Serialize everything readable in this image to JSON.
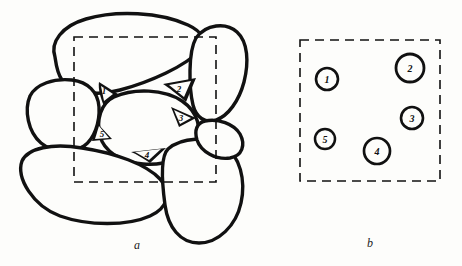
{
  "figure": {
    "background_color": "#fdfdfb",
    "ink_color": "#111111",
    "panels": [
      {
        "id": "a",
        "caption": "a",
        "description": "grain-packing-with-pore-spaces"
      },
      {
        "id": "b",
        "caption": "b",
        "description": "abstracted-pore-centers"
      }
    ]
  },
  "panel_a": {
    "caption": "a",
    "dashed_window": {
      "x": 74,
      "y": 37,
      "width": 142,
      "height": 145,
      "stroke": "#111111",
      "dash": "9 6",
      "stroke_width": 1.6
    },
    "grain_stroke": "#111111",
    "grain_stroke_width": 3.4,
    "grain_fill": "#fdfdfb",
    "pore_labels": [
      {
        "id": "1",
        "text": "1",
        "x": 106,
        "y": 91
      },
      {
        "id": "2",
        "text": "2",
        "x": 179,
        "y": 66
      },
      {
        "id": "3",
        "text": "3",
        "x": 180,
        "y": 115
      },
      {
        "id": "4",
        "text": "4",
        "x": 146,
        "y": 148
      },
      {
        "id": "5",
        "text": "5",
        "x": 104,
        "y": 133
      }
    ]
  },
  "panel_b": {
    "caption": "b",
    "dashed_window": {
      "x": 50,
      "y": 40,
      "width": 140,
      "height": 141,
      "stroke": "#111111",
      "dash": "9 6",
      "stroke_width": 1.6
    },
    "circle_stroke": "#111111",
    "circle_stroke_width": 2.6,
    "circle_fill": "#fdfdfb",
    "circles": [
      {
        "id": "1",
        "label": "1",
        "cx": 77,
        "cy": 79,
        "r": 11
      },
      {
        "id": "2",
        "label": "2",
        "cx": 160,
        "cy": 68,
        "r": 14
      },
      {
        "id": "3",
        "label": "3",
        "cx": 162,
        "cy": 118,
        "r": 11
      },
      {
        "id": "4",
        "label": "4",
        "cx": 127,
        "cy": 151,
        "r": 13
      },
      {
        "id": "5",
        "label": "5",
        "cx": 75,
        "cy": 139,
        "r": 10
      }
    ]
  }
}
